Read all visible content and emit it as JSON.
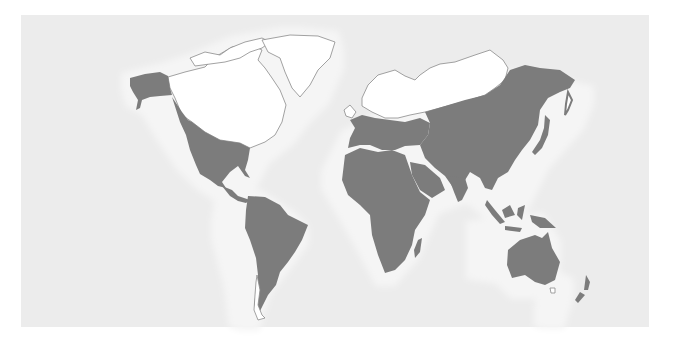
{
  "map": {
    "type": "world-map",
    "projection": "Robinson-like, Pacific split",
    "colors": {
      "background": "#ffffff",
      "ocean_panel": "#ececec",
      "coastal_halo": "#f4f4f4",
      "shaded_land": "#7c7c7c",
      "unshaded_land": "#ffffff",
      "outline": "#8a8a8a"
    },
    "regions": [
      {
        "name": "north-america-north",
        "state": "unshaded"
      },
      {
        "name": "greenland",
        "state": "unshaded"
      },
      {
        "name": "alaska",
        "state": "shaded"
      },
      {
        "name": "north-america-south",
        "state": "shaded"
      },
      {
        "name": "central-america",
        "state": "shaded"
      },
      {
        "name": "south-america",
        "state": "shaded"
      },
      {
        "name": "tierra-del-fuego-chile-south",
        "state": "unshaded"
      },
      {
        "name": "northern-europe-russia-arctic",
        "state": "unshaded"
      },
      {
        "name": "europe-south",
        "state": "shaded"
      },
      {
        "name": "africa",
        "state": "shaded"
      },
      {
        "name": "madagascar",
        "state": "shaded"
      },
      {
        "name": "asia",
        "state": "shaded"
      },
      {
        "name": "japan",
        "state": "shaded"
      },
      {
        "name": "southeast-asia-islands",
        "state": "shaded"
      },
      {
        "name": "australia",
        "state": "shaded"
      },
      {
        "name": "tasmania",
        "state": "unshaded"
      },
      {
        "name": "new-zealand",
        "state": "shaded"
      }
    ]
  }
}
